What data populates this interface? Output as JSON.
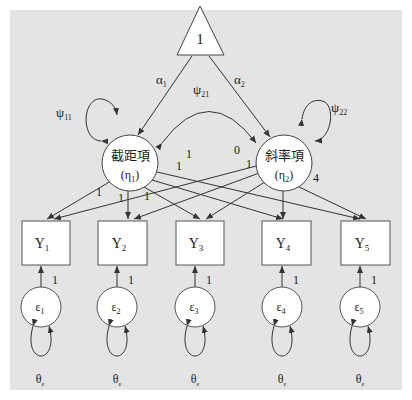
{
  "diagram": {
    "type": "latent growth curve model",
    "constant": {
      "label": "1"
    },
    "latents": [
      {
        "id": "eta1",
        "name": "截距項",
        "symbol": "η",
        "sub": "1",
        "variance": "ψ",
        "variance_sub": "11",
        "mean": "α",
        "mean_sub": "1"
      },
      {
        "id": "eta2",
        "name": "斜率項",
        "symbol": "η",
        "sub": "2",
        "variance": "ψ",
        "variance_sub": "22",
        "mean": "α",
        "mean_sub": "2"
      }
    ],
    "covariance": {
      "symbol": "ψ",
      "sub": "21"
    },
    "observed": [
      {
        "symbol": "Y",
        "sub": "1"
      },
      {
        "symbol": "Y",
        "sub": "2"
      },
      {
        "symbol": "Y",
        "sub": "3"
      },
      {
        "symbol": "Y",
        "sub": "4"
      },
      {
        "symbol": "Y",
        "sub": "5"
      }
    ],
    "intercept_loadings": [
      "1",
      "1",
      "1",
      "1",
      "1"
    ],
    "slope_loadings": [
      "0",
      "1",
      "2",
      "3",
      "4"
    ],
    "errors": [
      {
        "symbol": "ε",
        "sub": "1",
        "loading": "1",
        "variance": "θ",
        "variance_sub": "ε"
      },
      {
        "symbol": "ε",
        "sub": "2",
        "loading": "1",
        "variance": "θ",
        "variance_sub": "ε"
      },
      {
        "symbol": "ε",
        "sub": "3",
        "loading": "1",
        "variance": "θ",
        "variance_sub": "ε"
      },
      {
        "symbol": "ε",
        "sub": "4",
        "loading": "1",
        "variance": "θ",
        "variance_sub": "ε"
      },
      {
        "symbol": "ε",
        "sub": "5",
        "loading": "1",
        "variance": "θ",
        "variance_sub": "ε"
      }
    ]
  }
}
